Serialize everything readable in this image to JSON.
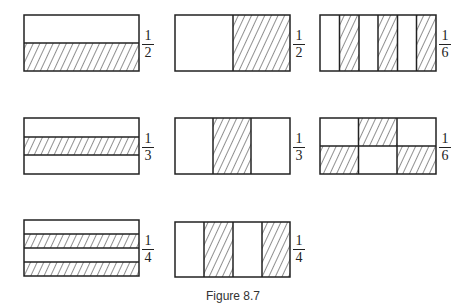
{
  "figure": {
    "caption": "Figure 8.7",
    "colors": {
      "stroke": "#222222",
      "background": "#ffffff"
    },
    "panels": [
      {
        "id": "half-horizontal",
        "fraction": {
          "numerator": "1",
          "denominator": "2"
        },
        "description": "rectangle split horizontally into 2, bottom half hatched"
      },
      {
        "id": "half-vertical",
        "fraction": {
          "numerator": "1",
          "denominator": "2"
        },
        "description": "rectangle split vertically into 2, right half hatched"
      },
      {
        "id": "sixth-vertical-strips",
        "fraction": {
          "numerator": "1",
          "denominator": "6"
        },
        "description": "rectangle split vertically into 6 strips, strips 2, 4, 6 hatched"
      },
      {
        "id": "third-horizontal",
        "fraction": {
          "numerator": "1",
          "denominator": "3"
        },
        "description": "rectangle split horizontally into 3, middle band hatched"
      },
      {
        "id": "third-vertical",
        "fraction": {
          "numerator": "1",
          "denominator": "3"
        },
        "description": "rectangle split vertically into 3, middle column hatched"
      },
      {
        "id": "sixth-grid",
        "fraction": {
          "numerator": "1",
          "denominator": "6"
        },
        "description": "2x3 grid, top-middle, bottom-left and bottom-right cells hatched"
      },
      {
        "id": "quarter-horizontal",
        "fraction": {
          "numerator": "1",
          "denominator": "4"
        },
        "description": "rectangle split horizontally into 4, bands 2 and 4 hatched"
      },
      {
        "id": "quarter-vertical",
        "fraction": {
          "numerator": "1",
          "denominator": "4"
        },
        "description": "rectangle split vertically into 4, columns 2 and 4 hatched"
      }
    ]
  }
}
